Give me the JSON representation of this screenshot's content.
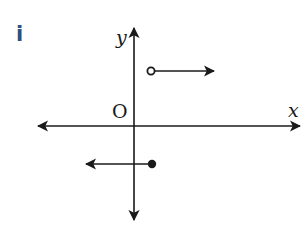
{
  "figure": {
    "part_label": "i",
    "part_label_color": "#2f4f7f",
    "axes": {
      "x_label": "x",
      "y_label": "y",
      "origin_label": "O",
      "color": "#1a1a1a"
    },
    "rays": [
      {
        "name": "upper-ray",
        "endpoint": "open",
        "direction": "right",
        "region": "positive y, positive x"
      },
      {
        "name": "lower-ray",
        "endpoint": "closed",
        "direction": "left",
        "region": "negative y"
      }
    ]
  }
}
